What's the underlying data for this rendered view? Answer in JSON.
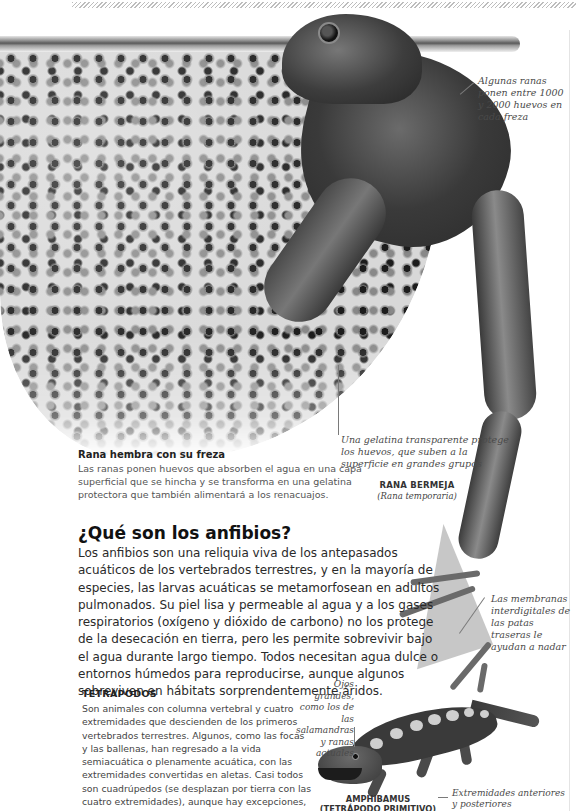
{
  "page": {
    "type": "encyclopedia spread",
    "palette": {
      "text": "#2a2a2a",
      "caption": "#555555",
      "annotation": "#4a4a4a",
      "rule": "#e4e4e4"
    }
  },
  "figure_frog": {
    "annotations": {
      "eggs_count": "Algunas ranas ponen entre 1000 y 2000 huevos en cada freza",
      "gelatin": "Una gelatina transparente protege los huevos, que suben a la superficie en grandes grupos",
      "webbing": "Las membranas interdigitales de las patas traseras le ayudan a nadar"
    },
    "species": {
      "name": "RANA BERMEJA",
      "latin": "(Rana temporaria)"
    },
    "caption": {
      "title": "Rana hembra con su freza",
      "text": "Las ranas ponen huevos que absorben el agua en una capa superficial que se hincha y se transforma en una gelatina protectora que también alimentará a los renacuajos."
    }
  },
  "section": {
    "heading": "¿Qué son los anfibios?",
    "body": "Los anfibios son una reliquia viva de los antepasados acuáticos de los vertebrados terrestres, y en la mayoría de especies, las larvas acuáticas se metamorfosean en adultos pulmonados. Su piel lisa y permeable al agua y a los gases respiratorios (oxígeno y dióxido de carbono) no los protege de la desecación en tierra, pero les permite sobrevivir bajo el agua durante largo tiempo. Todos necesitan agua dulce o entornos húmedos para reproducirse, aunque algunos sobreviven en hábitats sorprendentemente áridos."
  },
  "tetrapods": {
    "title": "TETRÁPODOS",
    "text": "Son animales con columna vertebral y cuatro extremidades que descienden de los primeros vertebrados terrestres. Algunos, como las focas y las ballenas, han regresado a la vida semiacuática o plenamente acuática, con las extremidades convertidas en aletas. Casi todos son cuadrúpedos (se desplazan por tierra con las cuatro extremidades), aunque hay excepciones, como las cecilias, las serpientes, las aves y los seres humanos."
  },
  "figure_amphibamus": {
    "annotations": {
      "eyes": "Ojos grandes, como los de las salamandras y ranas actuales",
      "limbs": "Extremidades anteriores y posteriores"
    },
    "name_line1": "AMPHIBAMUS",
    "name_line2": "(TETRÁPODO PRIMITIVO)"
  }
}
